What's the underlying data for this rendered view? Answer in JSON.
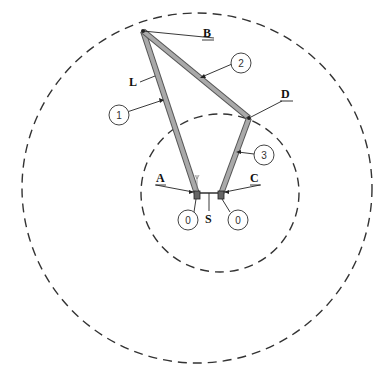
{
  "diagram": {
    "type": "four-bar linkage sketch",
    "point_labels": {
      "A": "A",
      "B": "B",
      "C": "C",
      "D": "D",
      "S": "S",
      "L": "L"
    },
    "balloons": {
      "link1": "1",
      "link2": "2",
      "link3": "3",
      "ground_left": "0",
      "ground_right": "0"
    },
    "circles": {
      "outer": "dashed circle (path of B)",
      "inner": "dashed circle (path of D)"
    },
    "colors": {
      "link_fill": "#a9a9a9",
      "link_edge": "#555555",
      "line": "#333333",
      "background": "#ffffff"
    }
  }
}
